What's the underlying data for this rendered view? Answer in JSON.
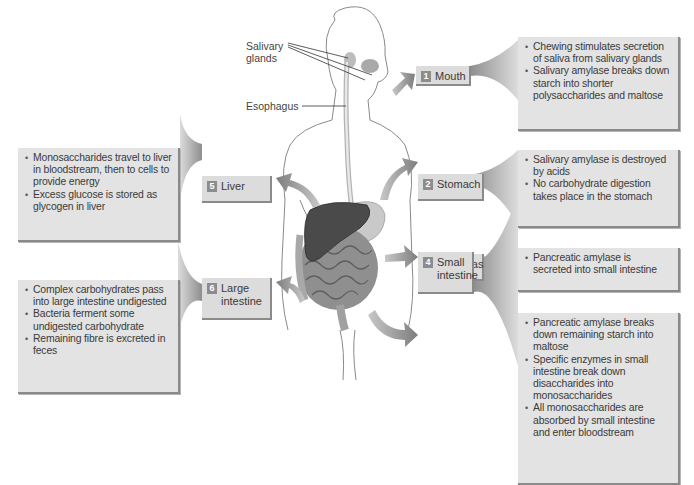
{
  "annotations": {
    "salivary_glands": "Salivary\nglands",
    "salivary_line1": "Salivary",
    "salivary_line2": "glands",
    "esophagus": "Esophagus"
  },
  "steps": [
    {
      "number": "1",
      "organ": "Mouth",
      "bullets": [
        "Chewing stimulates secretion of saliva from salivary glands",
        "Salivary amylase breaks down starch into shorter polysaccharides and maltose"
      ]
    },
    {
      "number": "2",
      "organ": "Stomach",
      "bullets": [
        "Salivary amylase is destroyed by acids",
        "No carbohydrate digestion takes place in the stomach"
      ]
    },
    {
      "number": "3",
      "organ": "Pancreas",
      "bullets": [
        "Pancreatic amylase is secreted into small intestine"
      ]
    },
    {
      "number": "4",
      "organ": "Small intestine",
      "organ_line1": "Small",
      "organ_line2": "intestine",
      "bullets": [
        "Pancreatic amylase breaks down remaining starch into maltose",
        "Specific enzymes in small intestine break down disaccharides into monosaccharides",
        "All monosaccharides are absorbed by small intestine and enter bloodstream"
      ]
    },
    {
      "number": "5",
      "organ": "Liver",
      "bullets": [
        "Monosaccharides travel to liver in bloodstream, then to cells to provide energy",
        "Excess glucose is stored as glycogen in liver"
      ]
    },
    {
      "number": "6",
      "organ": "Large intestine",
      "organ_line1": "Large",
      "organ_line2": "intestine",
      "bullets": [
        "Complex carbohydrates pass into large intestine undigested",
        "Bacteria ferment some undigested carbohydrate",
        "Remaining fibre is excreted in feces"
      ]
    }
  ],
  "colors": {
    "box_fill": "#e3e3e3",
    "label_fill": "#dcdcdc",
    "number_badge": "#8c8c8c",
    "arrow": "#9a9a9a",
    "liver": "#4a4a4a",
    "body_outline": "#8a8a8a"
  }
}
